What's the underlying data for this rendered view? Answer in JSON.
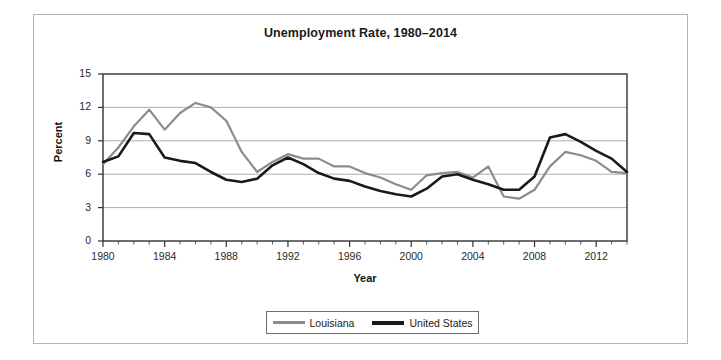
{
  "chart_data": {
    "type": "line",
    "title": "Unemployment Rate, 1980–2014",
    "xlabel": "Year",
    "ylabel": "Percent",
    "xlim": [
      1980,
      2014
    ],
    "ylim": [
      0,
      15
    ],
    "yticks": [
      0,
      3,
      6,
      9,
      12,
      15
    ],
    "xticks": [
      1980,
      1984,
      1988,
      1992,
      1996,
      2000,
      2004,
      2008,
      2012
    ],
    "grid": "horizontal",
    "legend_position": "bottom-center",
    "x": [
      1980,
      1981,
      1982,
      1983,
      1984,
      1985,
      1986,
      1987,
      1988,
      1989,
      1990,
      1991,
      1992,
      1993,
      1994,
      1995,
      1996,
      1997,
      1998,
      1999,
      2000,
      2001,
      2002,
      2003,
      2004,
      2005,
      2006,
      2007,
      2008,
      2009,
      2010,
      2011,
      2012,
      2013,
      2014
    ],
    "series": [
      {
        "name": "Louisiana",
        "color": "#8c8c8c",
        "values": [
          6.9,
          8.4,
          10.3,
          11.8,
          10.0,
          11.5,
          12.4,
          12.0,
          10.8,
          8.0,
          6.2,
          7.1,
          7.8,
          7.4,
          7.4,
          6.7,
          6.7,
          6.1,
          5.7,
          5.1,
          4.6,
          5.9,
          6.1,
          6.2,
          5.7,
          6.7,
          4.0,
          3.8,
          4.6,
          6.7,
          8.0,
          7.7,
          7.2,
          6.2,
          6.1
        ]
      },
      {
        "name": "United States",
        "color": "#1a1a1a",
        "values": [
          7.1,
          7.6,
          9.7,
          9.6,
          7.5,
          7.2,
          7.0,
          6.2,
          5.5,
          5.3,
          5.6,
          6.8,
          7.5,
          6.9,
          6.1,
          5.6,
          5.4,
          4.9,
          4.5,
          4.2,
          4.0,
          4.7,
          5.8,
          6.0,
          5.5,
          5.1,
          4.6,
          4.6,
          5.8,
          9.3,
          9.6,
          8.9,
          8.1,
          7.4,
          6.2
        ]
      }
    ]
  },
  "legend": {
    "items": [
      {
        "label": "Louisiana",
        "color": "#8c8c8c"
      },
      {
        "label": "United States",
        "color": "#1a1a1a"
      }
    ]
  }
}
